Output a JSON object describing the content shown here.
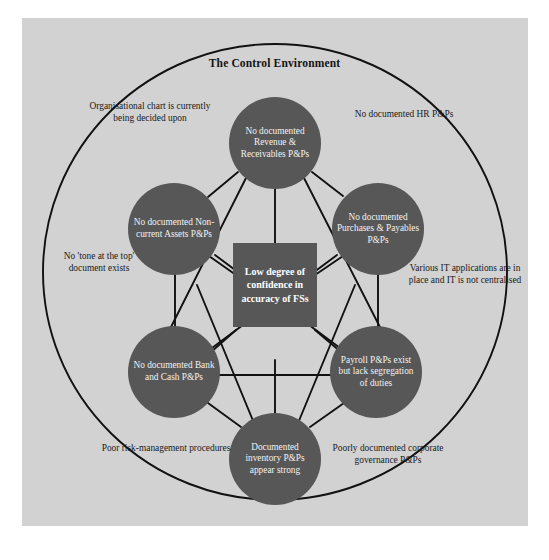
{
  "canvas": {
    "width": 549,
    "height": 560,
    "page_background": "#ffffff",
    "panel_background": "#d2d2d2",
    "node_fill": "#575757",
    "node_text_color": "#f2f2f2",
    "line_color": "#111111",
    "boundary_color": "#111111"
  },
  "diagram": {
    "title": "The Control Environment",
    "type": "network",
    "boundary_shape": "ellipse"
  },
  "center": {
    "label": "Low degree of confidence in accuracy of FSs",
    "shape": "square"
  },
  "nodes": [
    {
      "id": "revenue",
      "label": "No documented Revenue & Receivables P&Ps",
      "position": "top"
    },
    {
      "id": "purchases",
      "label": "No documented Purchases & Payables P&Ps",
      "position": "upper-right"
    },
    {
      "id": "payroll",
      "label": "Payroll P&Ps exist but lack segregation of duties",
      "position": "lower-right"
    },
    {
      "id": "inventory",
      "label": "Documented inventory P&Ps appear strong",
      "position": "bottom"
    },
    {
      "id": "bank",
      "label": "No documented Bank and Cash P&Ps",
      "position": "lower-left"
    },
    {
      "id": "noncurrent",
      "label": "No documented Non-current Assets P&Ps",
      "position": "upper-left"
    }
  ],
  "annotations": [
    {
      "id": "org-chart",
      "label": "Organisational chart is currently being decided upon"
    },
    {
      "id": "hr",
      "label": "No documented HR P&Ps"
    },
    {
      "id": "tone",
      "label": "No 'tone at the top' document exists"
    },
    {
      "id": "it",
      "label": "Various IT applications are in place and IT is not centralised"
    },
    {
      "id": "risk",
      "label": "Poor risk-management procedures"
    },
    {
      "id": "governance",
      "label": "Poorly documented corporate governance P&Ps"
    }
  ]
}
